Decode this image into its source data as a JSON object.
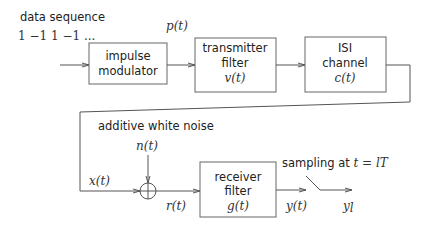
{
  "diagram": {
    "type": "block-diagram",
    "input": {
      "label_line1": "data sequence",
      "label_line2": "1 −1 1 −1 ..."
    },
    "blocks": [
      {
        "id": "impulse-modulator",
        "line1": "impulse",
        "line2": "modulator",
        "line3": ""
      },
      {
        "id": "transmitter-filter",
        "line1": "transmitter",
        "line2": "filter",
        "line3": "v(t)"
      },
      {
        "id": "isi-channel",
        "line1": "ISI",
        "line2": "channel",
        "line3": "c(t)"
      },
      {
        "id": "receiver-filter",
        "line1": "receiver",
        "line2": "filter",
        "line3": "g(t)"
      }
    ],
    "signals": {
      "p": "p(t)",
      "x": "x(t)",
      "n": "n(t)",
      "r": "r(t)",
      "y": "y(t)",
      "yl_base": "y",
      "yl_sub": "l"
    },
    "noise_label": "additive white noise",
    "sampler_label_text": "sampling at ",
    "sampler_label_math": "t = lT",
    "summer_symbol": "plus-circle"
  }
}
